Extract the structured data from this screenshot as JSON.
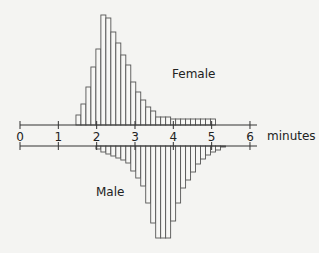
{
  "chart_data": {
    "type": "bar",
    "title": "",
    "xlabel": "minutes",
    "ylabel": "",
    "x_ticks": [
      0,
      1,
      2,
      3,
      4,
      5,
      6
    ],
    "xlim": [
      0,
      6.2
    ],
    "grid": false,
    "legend": "none (series labeled inline)",
    "orientation": "back-to-back histogram: Female above axis, Male below axis",
    "bin_width_minutes": 0.13,
    "units": "relative frequency (pixel heights)",
    "series": [
      {
        "name": "Female",
        "label": "Female",
        "position": "above",
        "bin_start_minutes": 1.46,
        "values": [
          10,
          21,
          38,
          58,
          76,
          110,
          107,
          93,
          82,
          70,
          60,
          43,
          33,
          25,
          18,
          14,
          8,
          8,
          8,
          6,
          6,
          6,
          6,
          6,
          6,
          6,
          6,
          6
        ]
      },
      {
        "name": "Male",
        "label": "Male",
        "position": "below",
        "bin_start_minutes": 1.98,
        "values": [
          3,
          6,
          8,
          10,
          12,
          14,
          17,
          25,
          32,
          40,
          57,
          77,
          92,
          92,
          92,
          75,
          57,
          42,
          34,
          26,
          18,
          13,
          9,
          6,
          4,
          1
        ]
      }
    ]
  },
  "colors": {
    "bar_fill": "#f7f7f5",
    "bar_stroke": "#555555",
    "axis": "#333333",
    "text": "#222222",
    "background": "#f4f4f2"
  }
}
